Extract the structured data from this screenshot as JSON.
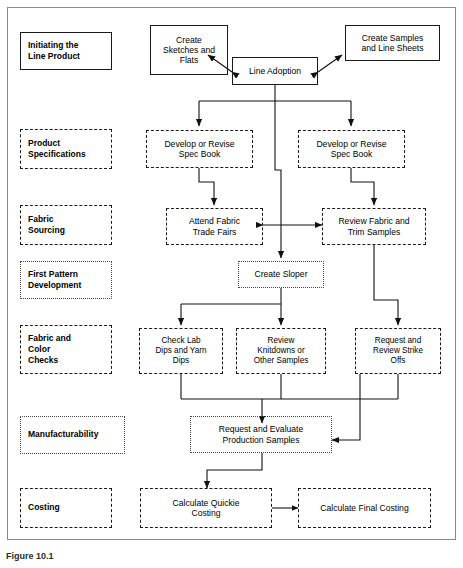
{
  "figure": {
    "caption": "Figure 10.1",
    "frame_border_color": "#8a8a8a"
  },
  "stages": [
    {
      "id": "initiating",
      "label": "Initiating the\nLine Product",
      "border": "solid"
    },
    {
      "id": "product-specifications",
      "label": "Product\nSpecifications",
      "border": "dashed"
    },
    {
      "id": "fabric-sourcing",
      "label": "Fabric\nSourcing",
      "border": "dashed"
    },
    {
      "id": "first-pattern-development",
      "label": "First Pattern\nDevelopment",
      "border": "dotted"
    },
    {
      "id": "fabric-and-color-checks",
      "label": "Fabric and\nColor\nChecks",
      "border": "dashed"
    },
    {
      "id": "manufacturability",
      "label": "Manufacturability",
      "border": "dotted"
    },
    {
      "id": "costing",
      "label": "Costing",
      "border": "dashed"
    }
  ],
  "nodes": [
    {
      "id": "create-sketches-and-flats",
      "label": "Create\nSketches and\nFlats",
      "border": "solid"
    },
    {
      "id": "line-adoption",
      "label": "Line Adoption",
      "border": "solid"
    },
    {
      "id": "create-samples-and-line-sheets",
      "label": "Create Samples\nand Line Sheets",
      "border": "solid"
    },
    {
      "id": "develop-or-revise-spec-book-left",
      "label": "Develop or Revise\nSpec Book",
      "border": "dashed"
    },
    {
      "id": "develop-or-revise-spec-book-right",
      "label": "Develop or Revise\nSpec Book",
      "border": "dashed"
    },
    {
      "id": "attend-fabric-trade-fairs",
      "label": "Attend Fabric\nTrade Fairs",
      "border": "dashed"
    },
    {
      "id": "review-fabric-and-trim-samples",
      "label": "Review Fabric and\nTrim Samples",
      "border": "dashed"
    },
    {
      "id": "create-sloper",
      "label": "Create Sloper",
      "border": "dotted"
    },
    {
      "id": "check-lab-dips-and-yarn-dips",
      "label": "Check Lab\nDips and Yarn\nDips",
      "border": "dashed"
    },
    {
      "id": "review-knitdowns-or-other-samples",
      "label": "Review\nKnitdowns or\nOther Samples",
      "border": "dashed"
    },
    {
      "id": "request-and-review-strike-offs",
      "label": "Request and\nReview Strike\nOffs",
      "border": "dashed"
    },
    {
      "id": "request-and-evaluate-production-samples",
      "label": "Request and Evaluate\nProduction Samples",
      "border": "dotted"
    },
    {
      "id": "calculate-quickie-costing",
      "label": "Calculate Quickie\nCosting",
      "border": "dashed"
    },
    {
      "id": "calculate-final-costing",
      "label": "Calculate Final Costing",
      "border": "dashed"
    }
  ],
  "chart_data": {
    "type": "diagram",
    "stage_count": 7,
    "node_count": 14,
    "connections": [
      {
        "from": "line-adoption",
        "to": "create-sketches-and-flats",
        "style": "bidirectional"
      },
      {
        "from": "line-adoption",
        "to": "create-samples-and-line-sheets",
        "style": "bidirectional"
      },
      {
        "from": "line-adoption",
        "to": "develop-or-revise-spec-book-left",
        "style": "directed"
      },
      {
        "from": "line-adoption",
        "to": "develop-or-revise-spec-book-right",
        "style": "directed"
      },
      {
        "from": "line-adoption",
        "to": "create-sloper",
        "style": "directed"
      },
      {
        "from": "develop-or-revise-spec-book-left",
        "to": "attend-fabric-trade-fairs",
        "style": "directed"
      },
      {
        "from": "develop-or-revise-spec-book-right",
        "to": "review-fabric-and-trim-samples",
        "style": "directed"
      },
      {
        "from": "attend-fabric-trade-fairs",
        "to": "review-fabric-and-trim-samples",
        "style": "bidirectional"
      },
      {
        "from": "create-sloper",
        "to": "check-lab-dips-and-yarn-dips",
        "style": "directed"
      },
      {
        "from": "create-sloper",
        "to": "review-knitdowns-or-other-samples",
        "style": "directed"
      },
      {
        "from": "review-fabric-and-trim-samples",
        "to": "request-and-review-strike-offs",
        "style": "directed"
      },
      {
        "from": "check-lab-dips-and-yarn-dips",
        "to": "request-and-evaluate-production-samples",
        "style": "directed"
      },
      {
        "from": "review-knitdowns-or-other-samples",
        "to": "request-and-evaluate-production-samples",
        "style": "directed"
      },
      {
        "from": "request-and-review-strike-offs",
        "to": "request-and-evaluate-production-samples",
        "style": "directed"
      },
      {
        "from": "request-and-evaluate-production-samples",
        "to": "calculate-quickie-costing",
        "style": "directed"
      },
      {
        "from": "calculate-quickie-costing",
        "to": "calculate-final-costing",
        "style": "directed"
      }
    ]
  }
}
